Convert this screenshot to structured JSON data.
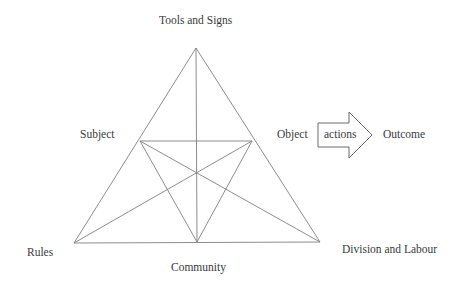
{
  "diagram": {
    "nodes": {
      "top": "Tools and Signs",
      "subject": "Subject",
      "object": "Object",
      "rules": "Rules",
      "community": "Community",
      "division": "Division and Labour",
      "outcome": "Outcome"
    },
    "arrow": {
      "label": "actions"
    },
    "colors": {
      "line": "#808080",
      "text": "#3a3a3a",
      "background": "#ffffff"
    }
  }
}
